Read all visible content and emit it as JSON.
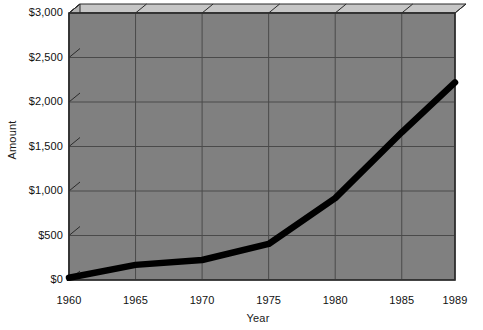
{
  "chart_data": {
    "type": "line",
    "title": "",
    "xlabel": "Year",
    "ylabel": "Amount",
    "x": [
      1960,
      1965,
      1970,
      1975,
      1980,
      1985,
      1989
    ],
    "values": [
      25,
      170,
      225,
      405,
      920,
      1660,
      2220
    ],
    "series": [
      {
        "name": "Amount",
        "values": [
          25,
          170,
          225,
          405,
          920,
          1660,
          2220
        ]
      }
    ],
    "xtick_labels": [
      "1960",
      "1965",
      "1970",
      "1975",
      "1980",
      "1985",
      "1989"
    ],
    "ytick_labels": [
      "$0",
      "$500",
      "$1,000",
      "$1,500",
      "$2,000",
      "$2,500",
      "$3,000"
    ],
    "ytick_values": [
      0,
      500,
      1000,
      1500,
      2000,
      2500,
      3000
    ],
    "xlim": [
      1960,
      1989
    ],
    "ylim": [
      0,
      3000
    ],
    "grid": true,
    "legend": "none",
    "style": "3d-wall",
    "colors": {
      "line": "#000000",
      "plot_background": "#808080",
      "gridline": "#4a4a4a",
      "wall_top": "#c6c6c6",
      "wall_side": "#b4b4b4",
      "frame": "#2b2b2b",
      "page_background": "#ffffff",
      "text": "#111111"
    }
  },
  "axes": {
    "y_title": "Amount",
    "x_title": "Year"
  }
}
